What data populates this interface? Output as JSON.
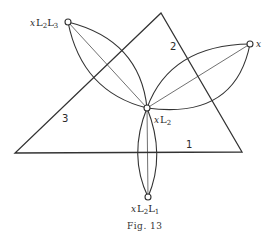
{
  "figure": {
    "caption": "Fig. 13",
    "triangle_sides": {
      "side1": "1",
      "side2": "2",
      "side3": "3"
    },
    "nodes": {
      "center": {
        "label_x": "x",
        "label_L": "L",
        "sub1": "2",
        "L2": "",
        "sub2": ""
      },
      "top_left": {
        "label_x": "x",
        "label_L": "L",
        "sub1": "2",
        "L2": "L",
        "sub2": "3"
      },
      "right": {
        "label_x": "x"
      },
      "bottom": {
        "label_x": "x",
        "label_L": "L",
        "sub1": "2",
        "L2": "L",
        "sub2": "1"
      }
    },
    "colors": {
      "stroke": "#333333",
      "background": "#ffffff"
    }
  }
}
